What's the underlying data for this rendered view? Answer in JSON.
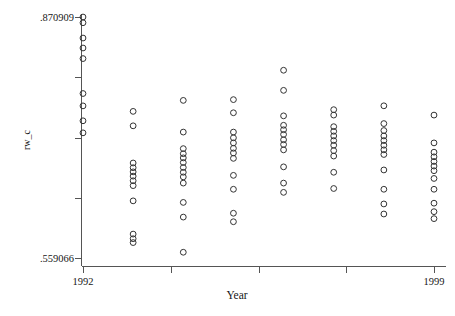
{
  "chart_data": {
    "type": "scatter",
    "title": "",
    "xlabel": "Year",
    "ylabel": "rw_c",
    "xlim": [
      1992,
      1999
    ],
    "ylim": [
      0.559066,
      0.870909
    ],
    "xticklabels": [
      "1992",
      "1999"
    ],
    "yticklabels": [
      ".870909",
      ".559066"
    ],
    "grid": false,
    "legend": false,
    "marker": "open-circle",
    "marker_color": "#333333",
    "x": [
      1992.0,
      1992.0,
      1992.0,
      1992.0,
      1992.0,
      1992.0,
      1992.0,
      1992.0,
      1992.0,
      1993.0,
      1993.0,
      1993.0,
      1993.0,
      1993.0,
      1993.0,
      1993.0,
      1993.0,
      1993.0,
      1993.0,
      1993.0,
      1993.0,
      1994.0,
      1994.0,
      1994.0,
      1994.0,
      1994.0,
      1994.0,
      1994.0,
      1994.0,
      1994.0,
      1994.0,
      1994.0,
      1994.0,
      1994.0,
      1995.0,
      1995.0,
      1995.0,
      1995.0,
      1995.0,
      1995.0,
      1995.0,
      1995.0,
      1995.0,
      1995.0,
      1995.0,
      1995.0,
      1996.0,
      1996.0,
      1996.0,
      1996.0,
      1996.0,
      1996.0,
      1996.0,
      1996.0,
      1996.0,
      1996.0,
      1996.0,
      1996.0,
      1997.0,
      1997.0,
      1997.0,
      1997.0,
      1997.0,
      1997.0,
      1997.0,
      1997.0,
      1997.0,
      1997.0,
      1997.0,
      1998.0,
      1998.0,
      1998.0,
      1998.0,
      1998.0,
      1998.0,
      1998.0,
      1998.0,
      1998.0,
      1998.0,
      1998.0,
      1998.0,
      1999.0,
      1999.0,
      1999.0,
      1999.0,
      1999.0,
      1999.0,
      1999.0,
      1999.0,
      1999.0,
      1999.0,
      1999.0,
      1999.0
    ],
    "y": [
      0.8709,
      0.8635,
      0.8437,
      0.8308,
      0.8171,
      0.7719,
      0.7559,
      0.7366,
      0.721,
      0.7488,
      0.7301,
      0.682,
      0.6759,
      0.6705,
      0.665,
      0.659,
      0.6527,
      0.633,
      0.59,
      0.584,
      0.579,
      0.763,
      0.722,
      0.7006,
      0.694,
      0.6886,
      0.6826,
      0.6762,
      0.67,
      0.664,
      0.656,
      0.631,
      0.612,
      0.5665,
      0.764,
      0.747,
      0.722,
      0.7146,
      0.708,
      0.701,
      0.695,
      0.688,
      0.666,
      0.648,
      0.617,
      0.606,
      0.802,
      0.776,
      0.743,
      0.7308,
      0.725,
      0.719,
      0.712,
      0.706,
      0.699,
      0.677,
      0.656,
      0.644,
      0.751,
      0.744,
      0.729,
      0.723,
      0.717,
      0.711,
      0.705,
      0.698,
      0.691,
      0.67,
      0.649,
      0.756,
      0.733,
      0.724,
      0.717,
      0.711,
      0.705,
      0.699,
      0.693,
      0.673,
      0.648,
      0.629,
      0.616,
      0.744,
      0.708,
      0.696,
      0.69,
      0.684,
      0.678,
      0.672,
      0.662,
      0.648,
      0.63,
      0.619,
      0.61
    ]
  },
  "axes": {
    "y_top_label": ".870909",
    "y_bottom_label": ".559066",
    "y_title": "rw_c",
    "x_left_label": "1992",
    "x_right_label": "1999",
    "x_title": "Year"
  }
}
